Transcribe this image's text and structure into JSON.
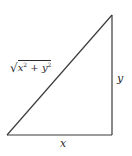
{
  "diagram": {
    "type": "right-triangle",
    "vertices": {
      "bottom_left": [
        7,
        135
      ],
      "bottom_right": [
        112,
        135
      ],
      "top_right": [
        112,
        15
      ]
    },
    "labels": {
      "hypotenuse": {
        "radical": "√",
        "x_var": "x",
        "x_exp": "2",
        "plus": " + ",
        "y_var": "y",
        "y_exp": "2"
      },
      "vertical_leg": "y",
      "horizontal_leg": "x"
    },
    "colors": {
      "stroke": "#3a3a3a",
      "text": "#2a2a2a",
      "background": "#ffffff"
    }
  }
}
